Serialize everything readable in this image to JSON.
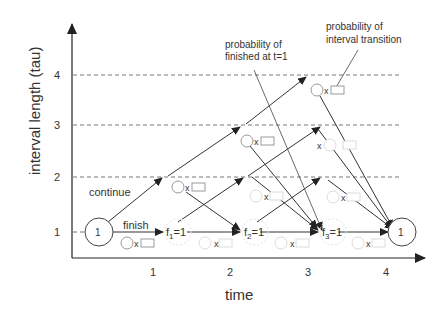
{
  "axes": {
    "y_label": "interval length (tau)",
    "x_label": "time",
    "y_ticks": [
      "1",
      "2",
      "3",
      "4"
    ],
    "x_ticks": [
      "1",
      "2",
      "3",
      "4"
    ]
  },
  "annotations": {
    "continue": "continue",
    "finish": "finish",
    "prob_finished_line1": "probability of",
    "prob_finished_line2": "finished at t=1",
    "prob_transition_line1": "probability of",
    "prob_transition_line2": "interval transition"
  },
  "nodes": {
    "start": "1",
    "end": "1",
    "f1_base": "f",
    "f1_sub": "1",
    "f1_val": "=1",
    "f2_base": "f",
    "f2_sub": "2",
    "f2_val": "=1",
    "f3_base": "f",
    "f3_sub": "3",
    "f3_val": "=1"
  },
  "multiplier": "x",
  "colors": {
    "line": "#333333",
    "dashed": "#777777",
    "faint": "#d8d8d8",
    "node": "#999999"
  }
}
